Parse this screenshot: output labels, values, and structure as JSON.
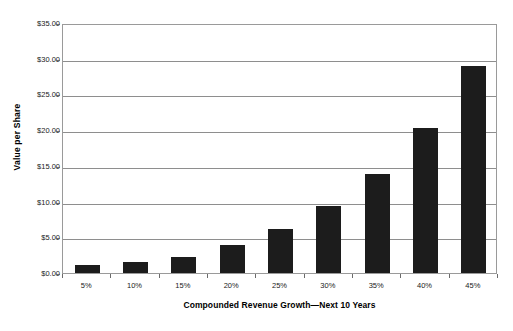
{
  "chart_data": {
    "type": "bar",
    "title": "",
    "xlabel": "Compounded Revenue Growth—Next 10 Years",
    "ylabel": "Value per Share",
    "categories": [
      "5%",
      "10%",
      "15%",
      "20%",
      "25%",
      "30%",
      "35%",
      "40%",
      "45%"
    ],
    "values": [
      1.15,
      1.6,
      2.25,
      3.95,
      6.15,
      9.4,
      13.8,
      20.3,
      29.0
    ],
    "ylim": [
      0,
      35
    ],
    "ytick_values": [
      0,
      5,
      10,
      15,
      20,
      25,
      30,
      35
    ],
    "ytick_labels": [
      "$0.00",
      "$5.00",
      "$10.00",
      "$15.00",
      "$20.00",
      "$25.00",
      "$30.00",
      "$35.00"
    ],
    "grid": true,
    "legend": "none",
    "bar_color": "#1c1c1c",
    "grid_color": "#8e8e8e",
    "frame_color": "#9a9a9a"
  }
}
